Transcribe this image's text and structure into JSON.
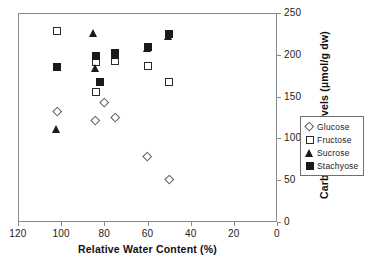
{
  "chart_data": {
    "type": "scatter",
    "title": "",
    "xlabel": "Relative Water Content (%)",
    "ylabel": "Carbohydrate levels (µmol/g dw)",
    "xlim": [
      120,
      0
    ],
    "ylim": [
      0,
      250
    ],
    "x_reversed": true,
    "xticks": [
      120,
      100,
      80,
      60,
      40,
      20,
      0
    ],
    "yticks": [
      0,
      50,
      100,
      150,
      200,
      250
    ],
    "grid": false,
    "legend_position": "right",
    "series": [
      {
        "name": "Glucose",
        "marker": "open-diamond",
        "points": [
          {
            "x": 102,
            "y": 133
          },
          {
            "x": 84,
            "y": 122
          },
          {
            "x": 80,
            "y": 143
          },
          {
            "x": 75,
            "y": 125
          },
          {
            "x": 60,
            "y": 79
          },
          {
            "x": 50,
            "y": 51
          }
        ]
      },
      {
        "name": "Fructose",
        "marker": "open-square",
        "points": [
          {
            "x": 102,
            "y": 228
          },
          {
            "x": 84,
            "y": 156
          },
          {
            "x": 84,
            "y": 191
          },
          {
            "x": 75,
            "y": 192
          },
          {
            "x": 60,
            "y": 187
          },
          {
            "x": 50,
            "y": 167
          }
        ]
      },
      {
        "name": "Sucrose",
        "marker": "filled-triangle",
        "points": [
          {
            "x": 102,
            "y": 111
          },
          {
            "x": 85,
            "y": 226
          },
          {
            "x": 84,
            "y": 184
          },
          {
            "x": 75,
            "y": 200
          },
          {
            "x": 60,
            "y": 208
          },
          {
            "x": 50,
            "y": 222
          }
        ]
      },
      {
        "name": "Stachyose",
        "marker": "filled-square",
        "points": [
          {
            "x": 102,
            "y": 185
          },
          {
            "x": 84,
            "y": 198
          },
          {
            "x": 82,
            "y": 168
          },
          {
            "x": 75,
            "y": 202
          },
          {
            "x": 60,
            "y": 209
          },
          {
            "x": 50,
            "y": 225
          }
        ]
      }
    ]
  },
  "legend": {
    "items": [
      {
        "label": "Glucose",
        "marker": "open-diamond"
      },
      {
        "label": "Fructose",
        "marker": "open-square"
      },
      {
        "label": "Sucrose",
        "marker": "filled-triangle"
      },
      {
        "label": "Stachyose",
        "marker": "filled-square"
      }
    ]
  }
}
